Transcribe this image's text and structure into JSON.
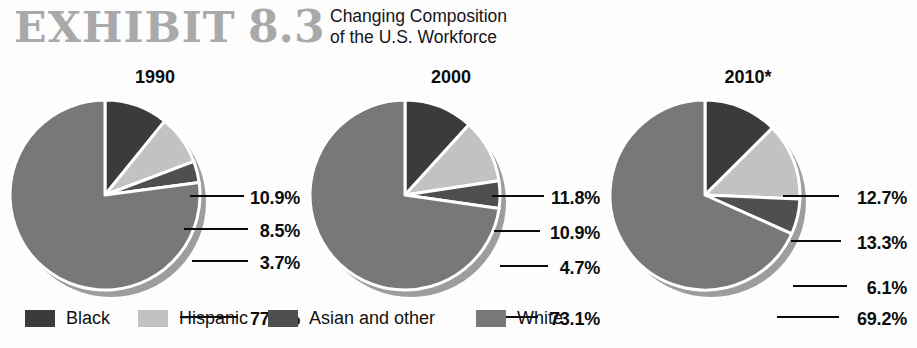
{
  "header": {
    "exhibit_label": "EXHIBIT",
    "exhibit_number": "8.3",
    "subtitle_line1": "Changing Composition",
    "subtitle_line2": "of the U.S. Workforce"
  },
  "colors": {
    "black": "#3b3b3b",
    "hispanic": "#c2c2c2",
    "asian": "#4f4f4f",
    "white": "#787878",
    "shadow": "#9d9d9d",
    "separator": "#ffffff",
    "leader": "#0b0b0b",
    "title_gray": "#a9a9a9",
    "text": "#0d0d0d",
    "background": "#fdfdfd"
  },
  "legend": {
    "items": [
      {
        "label": "Black",
        "color_key": "black",
        "left": 25
      },
      {
        "label": "Hispanic",
        "color_key": "hispanic",
        "left": 138
      },
      {
        "label": "Asian and other",
        "color_key": "asian",
        "left": 268
      },
      {
        "label": "White",
        "color_key": "white",
        "left": 476
      }
    ]
  },
  "chart_data": {
    "type": "pie",
    "title": "Changing Composition of the U.S. Workforce",
    "subtitle": "EXHIBIT 8.3",
    "footnote_marker": "*",
    "categories": [
      "Black",
      "Hispanic",
      "Asian and other",
      "White"
    ],
    "unit": "%",
    "legend_position": "bottom",
    "start_angle_deg": 0,
    "direction": "clockwise",
    "charts": [
      {
        "title": "1990",
        "values": [
          10.9,
          8.5,
          3.7,
          77.7
        ],
        "labels": [
          "10.9%",
          "8.5%",
          "3.7%",
          "77.7%"
        ]
      },
      {
        "title": "2000",
        "values": [
          11.8,
          10.9,
          4.7,
          73.1
        ],
        "labels": [
          "11.8%",
          "10.9%",
          "4.7%",
          "73.1%"
        ]
      },
      {
        "title": "2010*",
        "values": [
          12.7,
          13.3,
          6.1,
          69.2
        ],
        "labels": [
          "12.7%",
          "13.3%",
          "6.1%",
          "69.2%"
        ]
      }
    ]
  },
  "panels": [
    {
      "id": "1990",
      "year": "1990",
      "panel_left": 0,
      "year_left": 100,
      "year_width": 110,
      "cx": 105,
      "cy": 105,
      "r": 95,
      "labels": [
        {
          "text": "10.9%",
          "right_edge": 300,
          "y": 126,
          "leader_x1": 190,
          "leader_x2": 244,
          "leader_y": 133
        },
        {
          "text": "8.5%",
          "right_edge": 300,
          "y": 159,
          "leader_x1": 184,
          "leader_x2": 248,
          "leader_y": 166
        },
        {
          "text": "3.7%",
          "right_edge": 300,
          "y": 191,
          "leader_x1": 192,
          "leader_x2": 248,
          "leader_y": 198
        },
        {
          "text": "77.7%",
          "right_edge": 300,
          "y": 247,
          "leader_x1": 180,
          "leader_x2": 238,
          "leader_y": 254
        }
      ]
    },
    {
      "id": "2000",
      "year": "2000",
      "panel_left": 300,
      "year_left": 96,
      "year_width": 110,
      "cx": 105,
      "cy": 105,
      "r": 95,
      "labels": [
        {
          "text": "11.8%",
          "right_edge": 300,
          "y": 126,
          "leader_x1": 192,
          "leader_x2": 244,
          "leader_y": 133
        },
        {
          "text": "10.9%",
          "right_edge": 300,
          "y": 161,
          "leader_x1": 194,
          "leader_x2": 240,
          "leader_y": 168
        },
        {
          "text": "4.7%",
          "right_edge": 300,
          "y": 196,
          "leader_x1": 200,
          "leader_x2": 248,
          "leader_y": 203
        },
        {
          "text": "73.1%",
          "right_edge": 300,
          "y": 247,
          "leader_x1": 184,
          "leader_x2": 238,
          "leader_y": 254
        }
      ]
    },
    {
      "id": "2010",
      "year": "2010*",
      "panel_left": 607,
      "year_left": 86,
      "year_width": 110,
      "cx": 98,
      "cy": 105,
      "r": 95,
      "labels": [
        {
          "text": "12.7%",
          "right_edge": 300,
          "y": 126,
          "leader_x1": 176,
          "leader_x2": 232,
          "leader_y": 133
        },
        {
          "text": "13.3%",
          "right_edge": 300,
          "y": 171,
          "leader_x1": 184,
          "leader_x2": 234,
          "leader_y": 178
        },
        {
          "text": "6.1%",
          "right_edge": 300,
          "y": 216,
          "leader_x1": 186,
          "leader_x2": 240,
          "leader_y": 223
        },
        {
          "text": "69.2%",
          "right_edge": 300,
          "y": 247,
          "leader_x1": 170,
          "leader_x2": 232,
          "leader_y": 254
        }
      ]
    }
  ]
}
